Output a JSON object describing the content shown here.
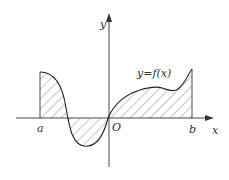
{
  "figure": {
    "type": "definite-integral-area-diagram",
    "function_label": "y=f(x)",
    "axes": {
      "x_label": "x",
      "y_label": "y",
      "origin_label": "O"
    },
    "interval": {
      "left_label": "a",
      "right_label": "b"
    },
    "colors": {
      "stroke": "#333333",
      "hatch": "#555555",
      "background": "#ffffff"
    }
  }
}
